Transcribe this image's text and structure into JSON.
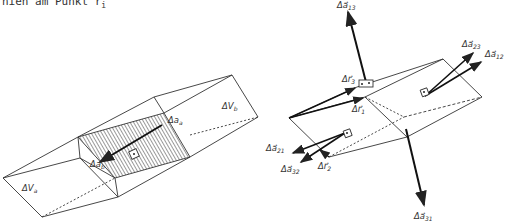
{
  "caption": {
    "text": "nien am Punkt r",
    "subscript": "i"
  },
  "left_figure": {
    "labels": {
      "volume_a": "ΔV",
      "volume_a_sub": "a",
      "volume_b": "ΔV",
      "volume_b_sub": "b",
      "area_a": "Δa",
      "area_a_sub": "a",
      "area_b": "Δa",
      "area_b_sub": "b"
    }
  },
  "right_figure": {
    "labels": {
      "a13": "Δa⃗",
      "a13_sub": "13",
      "a23": "Δa⃗",
      "a23_sub": "23",
      "a12": "Δa⃗",
      "a12_sub": "12",
      "a21": "Δa⃗",
      "a21_sub": "21",
      "a32": "Δa⃗",
      "a32_sub": "32",
      "a31": "Δa⃗",
      "a31_sub": "31",
      "r1": "Δr⃗",
      "r1_sub": "1",
      "r2": "Δr⃗",
      "r2_sub": "2",
      "r3": "Δr⃗",
      "r3_sub": "3"
    }
  },
  "colors": {
    "line": "#333333",
    "hatch": "#555555",
    "background": "#ffffff"
  }
}
